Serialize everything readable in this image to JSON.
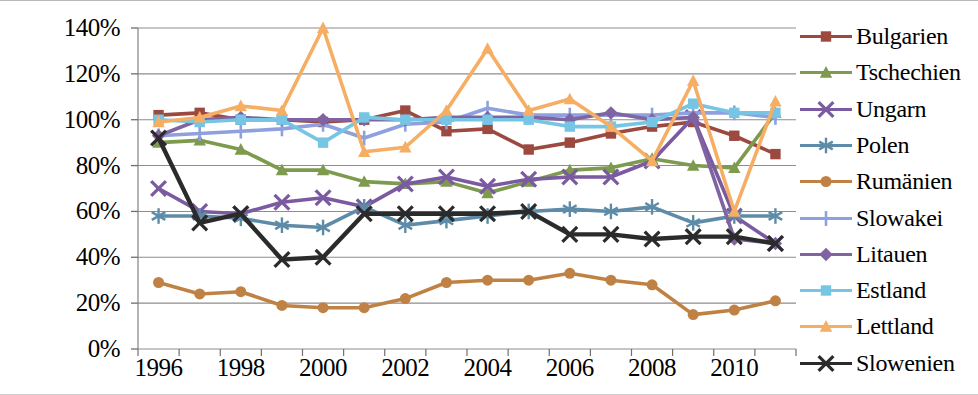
{
  "chart_data": {
    "type": "line",
    "title": "",
    "xlabel": "",
    "ylabel": "",
    "x": [
      1996,
      1997,
      1998,
      1999,
      2000,
      2001,
      2002,
      2003,
      2004,
      2005,
      2006,
      2007,
      2008,
      2009,
      2010,
      2011
    ],
    "x_tick_labels": [
      "1996",
      "1998",
      "2000",
      "2002",
      "2004",
      "2006",
      "2008",
      "2010"
    ],
    "x_tick_values": [
      1996,
      1998,
      2000,
      2002,
      2004,
      2006,
      2008,
      2010
    ],
    "y_tick_labels": [
      "0%",
      "20%",
      "40%",
      "60%",
      "80%",
      "100%",
      "120%",
      "140%"
    ],
    "y_tick_values": [
      0,
      20,
      40,
      60,
      80,
      100,
      120,
      140
    ],
    "ylim": [
      0,
      140
    ],
    "grid": true,
    "legend_position": "right",
    "series": [
      {
        "name": "Bulgarien",
        "color": "#9C4A40",
        "marker": "square",
        "values": [
          102,
          103,
          100,
          100,
          99,
          100,
          104,
          95,
          96,
          87,
          90,
          94,
          97,
          99,
          93,
          85
        ]
      },
      {
        "name": "Tschechien",
        "color": "#7D9A4E",
        "marker": "triangle",
        "values": [
          90,
          91,
          87,
          78,
          78,
          73,
          72,
          73,
          68,
          73,
          78,
          79,
          83,
          80,
          79,
          103
        ]
      },
      {
        "name": "Ungarn",
        "color": "#7A5AA0",
        "marker": "x",
        "values": [
          70,
          60,
          59,
          64,
          66,
          62,
          72,
          75,
          71,
          74,
          75,
          75,
          82,
          101,
          58,
          46
        ]
      },
      {
        "name": "Polen",
        "color": "#5E8CA8",
        "marker": "asterisk",
        "values": [
          58,
          58,
          57,
          54,
          53,
          62,
          54,
          56,
          58,
          60,
          61,
          60,
          62,
          55,
          58,
          58
        ]
      },
      {
        "name": "Rumänien",
        "color": "#C08244",
        "marker": "circle",
        "values": [
          29,
          24,
          25,
          19,
          18,
          18,
          22,
          29,
          30,
          30,
          33,
          30,
          28,
          15,
          17,
          21
        ]
      },
      {
        "name": "Slowakei",
        "color": "#8EA0DE",
        "marker": "plus",
        "values": [
          93,
          94,
          95,
          96,
          98,
          92,
          98,
          99,
          105,
          102,
          102,
          102,
          102,
          103,
          103,
          101
        ]
      },
      {
        "name": "Litauen",
        "color": "#8064A2",
        "marker": "diamond",
        "values": [
          93,
          100,
          101,
          100,
          100,
          100,
          100,
          101,
          101,
          101,
          100,
          103,
          100,
          101,
          48,
          46
        ]
      },
      {
        "name": "Estland",
        "color": "#76C5E4",
        "marker": "square",
        "values": [
          100,
          99,
          100,
          100,
          90,
          101,
          100,
          100,
          100,
          100,
          97,
          97,
          99,
          107,
          103,
          103
        ]
      },
      {
        "name": "Lettland",
        "color": "#F5AE63",
        "marker": "triangle",
        "values": [
          99,
          101,
          106,
          104,
          140,
          86,
          88,
          104,
          131,
          104,
          109,
          97,
          82,
          117,
          60,
          108
        ]
      },
      {
        "name": "Slowenien",
        "color": "#2B2B2B",
        "marker": "x",
        "values": [
          92,
          55,
          59,
          39,
          40,
          59,
          59,
          59,
          59,
          60,
          50,
          50,
          48,
          49,
          49,
          46
        ]
      }
    ]
  }
}
